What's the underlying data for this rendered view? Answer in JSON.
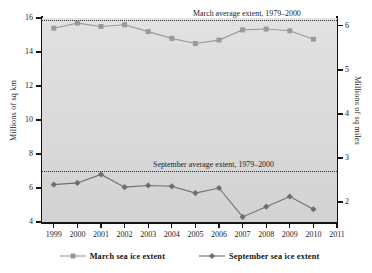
{
  "chart_data": {
    "type": "line",
    "title": "",
    "xlabel": "",
    "ylabel": "Millions of sq km",
    "ylabel_right": "Millions of sq miles",
    "x": [
      1999,
      2000,
      2001,
      2002,
      2003,
      2004,
      2005,
      2006,
      2007,
      2008,
      2009,
      2010
    ],
    "categories": [
      "1999",
      "2000",
      "2001",
      "2002",
      "2003",
      "2004",
      "2005",
      "2006",
      "2007",
      "2008",
      "2009",
      "2010"
    ],
    "xlim": [
      1998.5,
      2011
    ],
    "ylim": [
      4,
      16
    ],
    "ylim_right": [
      1.545,
      6.178
    ],
    "grid": false,
    "legend_position": "bottom",
    "series": [
      {
        "name": "March sea ice extent",
        "marker": "square",
        "color": "#9a9a9a",
        "values": [
          15.4,
          15.7,
          15.5,
          15.6,
          15.2,
          14.8,
          14.5,
          14.7,
          15.3,
          15.35,
          15.25,
          14.75
        ]
      },
      {
        "name": "September sea ice extent",
        "marker": "diamond",
        "color": "#6e6e6e",
        "values": [
          6.2,
          6.3,
          6.8,
          6.05,
          6.15,
          6.1,
          5.7,
          6.0,
          4.3,
          4.9,
          5.5,
          4.75
        ]
      }
    ],
    "reference_lines": [
      {
        "label": "March average extent, 1979–2000",
        "value": 15.9,
        "style": "dotted",
        "label_position": "above-right"
      },
      {
        "label": "September average extent, 1979–2000",
        "value": 7.0,
        "style": "dotted",
        "label_position": "above-right"
      }
    ],
    "y_ticks_left": [
      4,
      6,
      8,
      10,
      12,
      14,
      16
    ],
    "y_ticks_right": [
      2,
      3,
      4,
      5,
      6
    ],
    "x_ticks": [
      1999,
      2000,
      2001,
      2002,
      2003,
      2004,
      2005,
      2006,
      2007,
      2008,
      2009,
      2010,
      2011
    ]
  },
  "axes": {
    "left_title": "Millions of sq km",
    "right_title": "Millions of sq miles",
    "y_left_ticklabels": [
      "16",
      "14",
      "12",
      "10",
      "8",
      "6",
      "4"
    ],
    "y_right_ticklabels": [
      "6",
      "5",
      "4",
      "3",
      "2"
    ],
    "x_ticklabels": [
      "1999",
      "2000",
      "2001",
      "2002",
      "2003",
      "2004",
      "2005",
      "2006",
      "2007",
      "2008",
      "2009",
      "2010",
      "2011"
    ]
  },
  "annotations": {
    "march_avg": "March average extent, 1979–2000",
    "september_avg": "September average extent, 1979–2000"
  },
  "legend": {
    "items": [
      {
        "label": "March sea ice extent",
        "marker": "square-marker-icon",
        "color": "#9a9a9a"
      },
      {
        "label": "September sea ice extent",
        "marker": "diamond-marker-icon",
        "color": "#6e6e6e"
      }
    ]
  },
  "colors": {
    "march": "#9a9a9a",
    "september": "#6e6e6e",
    "axis": "#141414",
    "plot_background": "#dcdcdc",
    "reference_line": "#2b2b2b"
  }
}
